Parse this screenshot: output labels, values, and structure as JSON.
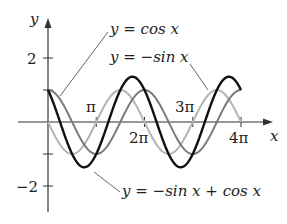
{
  "chart_data": {
    "type": "line",
    "title": "",
    "xlabel": "x",
    "ylabel": "y",
    "x_ticks": [
      "π",
      "2π",
      "3π",
      "4π"
    ],
    "y_ticks": [
      "2",
      "−2"
    ],
    "xlim": [
      0,
      12.566
    ],
    "ylim": [
      -2,
      2
    ],
    "grid": false,
    "series": [
      {
        "name": "y = cos x",
        "expr": "cos x",
        "color": "#7a7a7a",
        "domain": [
          0,
          12.566
        ]
      },
      {
        "name": "y = −sin x",
        "expr": "-sin x",
        "color": "#b4b4b4",
        "domain": [
          0,
          12.566
        ]
      },
      {
        "name": "y = −sin x + cos x",
        "expr": "-sin x + cos x",
        "color": "#111111",
        "domain": [
          0,
          12.566
        ]
      }
    ],
    "annotations": [
      {
        "text": "y = cos x",
        "points_to": "cos x"
      },
      {
        "text": "y = −sin x",
        "points_to": "-sin x"
      },
      {
        "text": "y = −sin x + cos x",
        "points_to": "-sin x + cos x"
      }
    ]
  },
  "labels": {
    "y_axis": "y",
    "x_axis": "x",
    "tick_pi": "π",
    "tick_2pi": "2π",
    "tick_3pi": "3π",
    "tick_4pi": "4π",
    "tick_y2": "2",
    "tick_yneg2": "−2",
    "cos_eq": "y = cos x",
    "negsin_eq": "y = −sin x",
    "sum_eq": "y = −sin x + cos x"
  }
}
